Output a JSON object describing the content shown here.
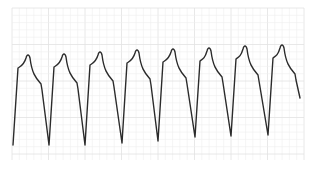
{
  "chart_data": {
    "type": "line",
    "title": "",
    "xlabel": "",
    "ylabel": "",
    "grid": true,
    "legend": null,
    "description": "ECG-style waveform strip with 8 repeating complexes over a faint grid",
    "beats": 8,
    "grid_area": {
      "x": 12,
      "y": 8,
      "width": 292,
      "height": 152
    },
    "colors": {
      "trace": "#2b2b2b",
      "grid_minor": "#efefef",
      "grid_major": "#e2e2e2",
      "background": "#ffffff"
    },
    "peaks": [
      {
        "x": 28,
        "y": 55
      },
      {
        "x": 64,
        "y": 54
      },
      {
        "x": 100,
        "y": 52
      },
      {
        "x": 137,
        "y": 50
      },
      {
        "x": 173,
        "y": 49
      },
      {
        "x": 209,
        "y": 48
      },
      {
        "x": 245,
        "y": 46
      },
      {
        "x": 282,
        "y": 45
      }
    ],
    "troughs": [
      {
        "x": 13,
        "y": 145
      },
      {
        "x": 49,
        "y": 145
      },
      {
        "x": 85,
        "y": 145
      },
      {
        "x": 122,
        "y": 143
      },
      {
        "x": 158,
        "y": 141
      },
      {
        "x": 195,
        "y": 137
      },
      {
        "x": 231,
        "y": 136
      },
      {
        "x": 268,
        "y": 135
      }
    ]
  }
}
